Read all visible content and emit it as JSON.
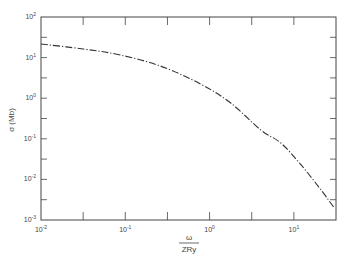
{
  "chart_data": {
    "type": "line",
    "title": "",
    "xlabel": "ω / ZRy",
    "xlabel_numerator": "ω",
    "xlabel_denominator": "ZRy",
    "ylabel": "σ (Mb)",
    "xscale": "log",
    "yscale": "log",
    "xlim": [
      0.01,
      31.6
    ],
    "ylim": [
      0.001,
      100
    ],
    "grid": false,
    "legend": null,
    "x_ticks": [
      {
        "base": "10",
        "exp": "-2",
        "value": 0.01
      },
      {
        "base": "10",
        "exp": "-1",
        "value": 0.1
      },
      {
        "base": "10",
        "exp": "0",
        "value": 1
      },
      {
        "base": "10",
        "exp": "1",
        "value": 10
      }
    ],
    "y_ticks": [
      {
        "base": "10",
        "exp": "2",
        "value": 100
      },
      {
        "base": "10",
        "exp": "1",
        "value": 10
      },
      {
        "base": "10",
        "exp": "0",
        "value": 1
      },
      {
        "base": "10",
        "exp": "-1",
        "value": 0.1
      },
      {
        "base": "10",
        "exp": "-2",
        "value": 0.01
      },
      {
        "base": "10",
        "exp": "-3",
        "value": 0.001
      }
    ],
    "series": [
      {
        "name": "σ",
        "style": "dash-dot",
        "color": "#333333",
        "x": [
          0.01,
          0.0316,
          0.087,
          0.26,
          0.78,
          1.78,
          4.05,
          7.0,
          12.1,
          21.0,
          30.0
        ],
        "y": [
          21.6,
          16.3,
          11.6,
          6.2,
          2.24,
          0.76,
          0.165,
          0.079,
          0.023,
          0.0055,
          0.002
        ]
      }
    ]
  }
}
